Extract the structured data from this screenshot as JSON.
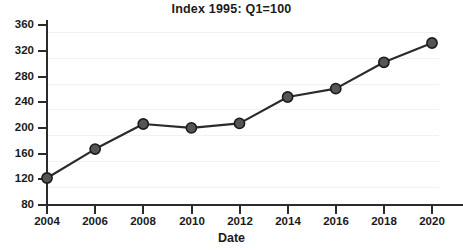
{
  "chart_data": {
    "type": "line",
    "title": "Index 1995: Q1=100",
    "xlabel": "Date",
    "ylabel": "",
    "x": [
      2004,
      2006,
      2008,
      2010,
      2012,
      2014,
      2016,
      2018,
      2020
    ],
    "values": [
      122,
      167,
      206,
      200,
      207,
      248,
      261,
      302,
      332
    ],
    "xtick_labels": [
      "2004",
      "2006",
      "2008",
      "2010",
      "2012",
      "2014",
      "2016",
      "2018",
      "2020"
    ],
    "ytick_labels": [
      "80",
      "120",
      "160",
      "200",
      "240",
      "280",
      "320",
      "360"
    ],
    "yticks": [
      80,
      120,
      160,
      200,
      240,
      280,
      320,
      360
    ],
    "ylim": [
      80,
      360
    ],
    "xlim": [
      2004,
      2020
    ],
    "grid": true,
    "legend": "none",
    "series": [
      {
        "name": "Index",
        "values": [
          122,
          167,
          206,
          200,
          207,
          248,
          261,
          302,
          332
        ]
      }
    ],
    "colors": {
      "line": "#2b2b2b",
      "marker_fill": "#555555",
      "marker_edge": "#1b1b1b",
      "grid": "#f1f1f1",
      "axis": "#2b2b2b",
      "text": "#1b1b1b",
      "background": "#ffffff"
    },
    "marker": "circle"
  }
}
